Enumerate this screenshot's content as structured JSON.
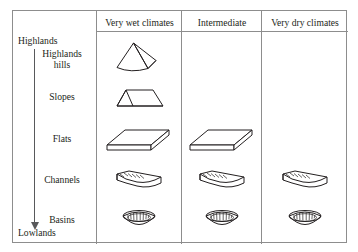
{
  "figure": {
    "axis": {
      "top_label": "Highlands",
      "bottom_label": "Lowlands",
      "arrow_icon": "down-arrow-icon",
      "arrow_direction": "down"
    },
    "columns": [
      {
        "id": "very-wet",
        "label": "Very wet climates"
      },
      {
        "id": "intermediate",
        "label": "Intermediate"
      },
      {
        "id": "very-dry",
        "label": "Very dry climates"
      }
    ],
    "rows": [
      {
        "id": "highlands-hills",
        "label": "Highlands\nhills",
        "label_line1": "Highlands",
        "label_line2": "hills",
        "icon": "cone-hill-icon",
        "present": [
          true,
          false,
          false
        ]
      },
      {
        "id": "slopes",
        "label": "Slopes",
        "icon": "wedge-slope-icon",
        "present": [
          true,
          false,
          false
        ]
      },
      {
        "id": "flats",
        "label": "Flats",
        "icon": "flat-slab-icon",
        "present": [
          true,
          true,
          false
        ]
      },
      {
        "id": "channels",
        "label": "Channels",
        "icon": "trough-channel-icon",
        "present": [
          true,
          true,
          true
        ]
      },
      {
        "id": "basins",
        "label": "Basins",
        "icon": "bowl-basin-icon",
        "present": [
          true,
          true,
          true
        ]
      }
    ],
    "colors": {
      "border": "#8d8d8d",
      "ink": "#231f20",
      "arrow": "#58595b",
      "background": "#ffffff"
    }
  }
}
